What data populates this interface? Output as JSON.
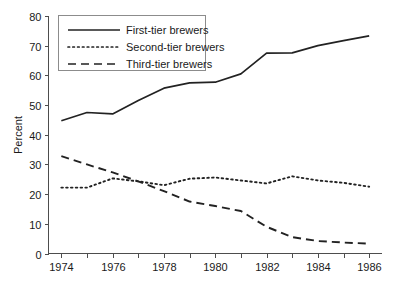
{
  "chart_data": {
    "type": "line",
    "title": "",
    "subtitle": "",
    "xlabel": "",
    "ylabel": "Percent",
    "xlim": [
      1973.5,
      1986.5
    ],
    "ylim": [
      0,
      80
    ],
    "xticks": [
      1974,
      1976,
      1978,
      1980,
      1982,
      1984,
      1986
    ],
    "xtick_labels": [
      "1974",
      "1976",
      "1978",
      "1980",
      "1982",
      "1984",
      "1986"
    ],
    "yticks": [
      0,
      10,
      20,
      30,
      40,
      50,
      60,
      70,
      80
    ],
    "ytick_labels": [
      "0",
      "10",
      "20",
      "30",
      "40",
      "50",
      "60",
      "70",
      "80"
    ],
    "minor_xticks": [
      1975,
      1977,
      1979,
      1981,
      1983,
      1985
    ],
    "grid": false,
    "legend_position": "top-left",
    "x": [
      1974,
      1975,
      1976,
      1977,
      1978,
      1979,
      1980,
      1981,
      1982,
      1983,
      1984,
      1985,
      1986
    ],
    "series": [
      {
        "name": "First-tier brewers",
        "style": "solid",
        "color": "#222222",
        "values": [
          44.7,
          47.5,
          47.0,
          51.5,
          55.7,
          57.5,
          57.7,
          60.5,
          67.5,
          67.6,
          70.0,
          71.7,
          73.3
        ]
      },
      {
        "name": "Second-tier brewers",
        "style": "dotted",
        "color": "#222222",
        "values": [
          22.2,
          22.2,
          25.3,
          24.3,
          23.0,
          25.2,
          25.6,
          24.6,
          23.6,
          26.0,
          24.6,
          23.8,
          22.5
        ]
      },
      {
        "name": "Third-tier brewers",
        "style": "dashed",
        "color": "#222222",
        "values": [
          32.8,
          30.0,
          27.3,
          24.3,
          21.0,
          17.5,
          16.0,
          14.3,
          9.0,
          5.5,
          4.2,
          3.7,
          3.3
        ]
      }
    ]
  },
  "legend": {
    "items": [
      {
        "label": "First-tier brewers",
        "style": "solid"
      },
      {
        "label": "Second-tier brewers",
        "style": "dotted"
      },
      {
        "label": "Third-tier brewers",
        "style": "dashed"
      }
    ]
  },
  "axis": {
    "y_title": "Percent"
  }
}
